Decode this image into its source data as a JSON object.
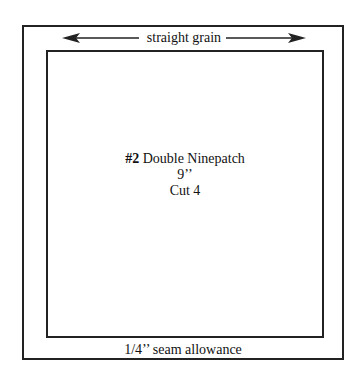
{
  "template": {
    "grain_label": "straight grain",
    "block_number": "#2",
    "block_name": "Double Ninepatch",
    "size": "9’’",
    "cut": "Cut 4",
    "seam_label": "1/4’’ seam allowance"
  }
}
